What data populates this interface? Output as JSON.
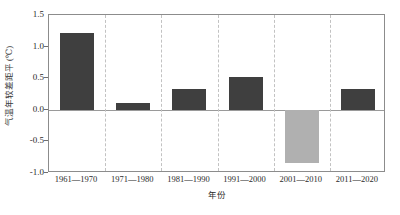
{
  "chart_data": {
    "type": "bar",
    "title": "",
    "xlabel": "年份",
    "ylabel": "气温年较差距平 (℃)",
    "categories": [
      "1961—1970",
      "1971—1980",
      "1981—1990",
      "1991—2000",
      "2001—2010",
      "2011—2020"
    ],
    "values": [
      1.21,
      0.11,
      0.33,
      0.52,
      -0.84,
      0.33
    ],
    "ylim": [
      -1.0,
      1.5
    ],
    "yticks": [
      "1.5",
      "1.0",
      "0.5",
      "0.0",
      "-0.5",
      "-1.0"
    ],
    "ytick_values": [
      1.5,
      1.0,
      0.5,
      0.0,
      -0.5,
      -1.0
    ],
    "grid": false,
    "category_dividers": true,
    "legend": "none",
    "colors": {
      "positive_bar": "#3f3f3f",
      "negative_bar": "#b0b0b0",
      "axis_frame": "#8c8c8c",
      "zero_line": "#9a9a9a",
      "divider": "#c2c2c2",
      "background": "#ffffff",
      "text": "#2b2b2b"
    }
  }
}
